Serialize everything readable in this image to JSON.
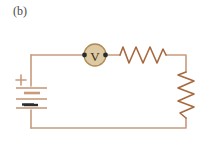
{
  "figure": {
    "panel_label": "(b)",
    "title": "",
    "type": "circuit-schematic",
    "colors": {
      "wire": "#c89a7c",
      "resistor": "#a8683f",
      "meter_fill": "#ddc9a3",
      "meter_stroke": "#b08a55",
      "terminal_dot": "#2b2b2b",
      "battery_plate": "#c89a7c",
      "battery_plate_dark": "#2b2b2b",
      "label_text": "#4a4a4a",
      "meter_text": "#3a2a18",
      "background": "#ffffff"
    },
    "components": {
      "voltmeter": {
        "name": "voltmeter",
        "symbol": "V",
        "cx": 95,
        "cy": 55,
        "r": 11
      },
      "resistor_top": {
        "name": "resistor",
        "orientation": "horizontal",
        "label": "",
        "x1": 120,
        "x2": 166,
        "y": 55,
        "peaks": 6
      },
      "resistor_right": {
        "name": "resistor",
        "orientation": "vertical",
        "label": "",
        "x": 186,
        "y1": 72,
        "y2": 118,
        "peaks": 6
      },
      "battery": {
        "name": "battery",
        "plus_label": "+",
        "minus_label": "−",
        "x": 31,
        "y_top": 86,
        "y_bottom": 110,
        "plates": 4
      }
    },
    "loop": {
      "left": 31,
      "right": 186,
      "top": 52,
      "bottom": 128
    }
  }
}
